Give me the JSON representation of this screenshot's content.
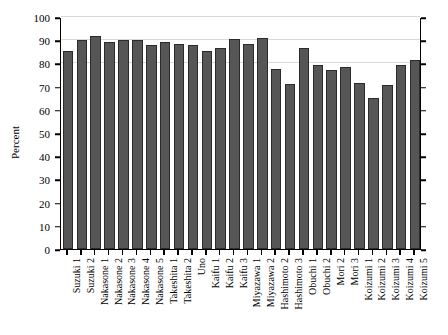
{
  "chart_data": {
    "type": "bar",
    "title": "",
    "xlabel": "",
    "ylabel": "Percent",
    "ylim": [
      0,
      100
    ],
    "ytick_labels": [
      "0",
      "10",
      "20",
      "30",
      "40",
      "50",
      "60",
      "70",
      "80",
      "90",
      "100"
    ],
    "ytick_values": [
      0,
      10,
      20,
      30,
      40,
      50,
      60,
      70,
      80,
      90,
      100
    ],
    "gridlines": [
      80,
      90,
      100
    ],
    "grid": true,
    "legend": "none",
    "categories": [
      "Suzuki 1",
      "Suzuki 2",
      "Nakasone 1",
      "Nakasone 2",
      "Nakasone 3",
      "Nakasone 4",
      "Nakasone 5",
      "Takeshita 1",
      "Takeshita 2",
      "Uno",
      "Kaifu 1",
      "Kaifu 2",
      "Kaifu 3",
      "Miyazawa 1",
      "Miyazawa 2",
      "Hashimoto 2",
      "Hashimoto 3",
      "Obuchi 1",
      "Obuchi 2",
      "Mori 2",
      "Mori 3",
      "Koizumi 1",
      "Koizumi 2",
      "Koizumi 3",
      "Koizumi 4",
      "Koizumi 5"
    ],
    "values": [
      85.5,
      90.0,
      92.0,
      89.3,
      90.2,
      90.2,
      88.0,
      89.2,
      88.2,
      87.8,
      85.2,
      86.5,
      90.5,
      88.5,
      90.8,
      77.5,
      71.0,
      86.5,
      79.5,
      77.0,
      78.5,
      71.5,
      65.0,
      70.5,
      79.5,
      81.5
    ]
  }
}
